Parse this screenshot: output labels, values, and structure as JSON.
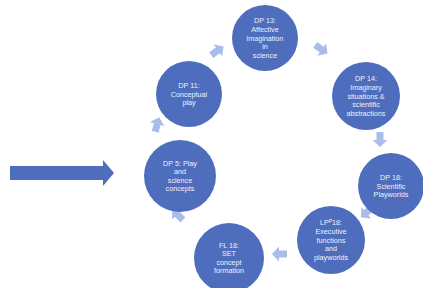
{
  "diagram": {
    "type": "cycle",
    "colors": {
      "node_fill": "#4f6dbd",
      "small_arrow": "#a9bde9",
      "entry_arrow": "#4f6dbd",
      "text": "#eef1fa",
      "background": "#ffffff"
    },
    "entry_arrow": {
      "target": "dp5"
    },
    "nodes": [
      {
        "id": "dp13",
        "lines": [
          "DP 13:",
          "Affective",
          "imagination",
          "in",
          "science"
        ]
      },
      {
        "id": "dp14",
        "lines": [
          "DP 14:",
          "Imaginary",
          "situations &",
          "scientific",
          "abstractions"
        ]
      },
      {
        "id": "dp18",
        "lines": [
          "DP 18:",
          "Scientific",
          "Playworlds"
        ]
      },
      {
        "id": "lp18",
        "lines": [
          "LPᴾ18:",
          "Executive",
          "functions",
          "and",
          "playworlds"
        ]
      },
      {
        "id": "fl18",
        "lines": [
          "FL 18:",
          "SET",
          "concept",
          "formation"
        ]
      },
      {
        "id": "dp5",
        "lines": [
          "DP 5: Play",
          "and",
          "science",
          "concepts"
        ]
      },
      {
        "id": "dp11",
        "lines": [
          "DP 11:",
          "Conceptual",
          "play"
        ]
      }
    ],
    "connections": [
      {
        "from": "dp13",
        "to": "dp14"
      },
      {
        "from": "dp14",
        "to": "dp18"
      },
      {
        "from": "dp18",
        "to": "lp18"
      },
      {
        "from": "lp18",
        "to": "fl18"
      },
      {
        "from": "fl18",
        "to": "dp5"
      },
      {
        "from": "dp5",
        "to": "dp11"
      },
      {
        "from": "dp11",
        "to": "dp13"
      }
    ]
  }
}
